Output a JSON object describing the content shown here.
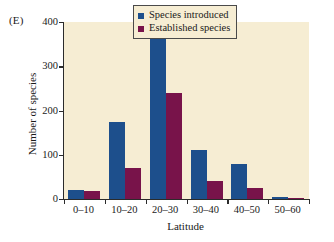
{
  "figure": {
    "panel_label": "(E)",
    "background_color": "#ffffff",
    "plot_background_color": "#f6edd3",
    "axis_color": "#2b2b2b"
  },
  "legend": {
    "position": "top-right-inside",
    "border_color": "#4a4a4a",
    "entries": [
      {
        "label": "Species introduced",
        "color": "#1d4f8c"
      },
      {
        "label": "Established species",
        "color": "#78134a"
      }
    ]
  },
  "chart_data": {
    "type": "bar",
    "title": "",
    "subtitle": "",
    "xlabel": "Latitude",
    "ylabel": "Number of species",
    "categories": [
      "0–10",
      "10–20",
      "20–30",
      "30–40",
      "40–50",
      "50–60"
    ],
    "series": [
      {
        "name": "Species introduced",
        "color": "#1d4f8c",
        "values": [
          20,
          175,
          380,
          110,
          80,
          5
        ]
      },
      {
        "name": "Established species",
        "color": "#78134a",
        "values": [
          19,
          70,
          240,
          40,
          26,
          2
        ]
      }
    ],
    "ylim": [
      0,
      400
    ],
    "yticks": [
      0,
      100,
      200,
      300,
      400
    ],
    "ytick_labels": [
      "0",
      "100",
      "200",
      "300",
      "400"
    ],
    "grid": false,
    "legend_position": "upper right"
  }
}
